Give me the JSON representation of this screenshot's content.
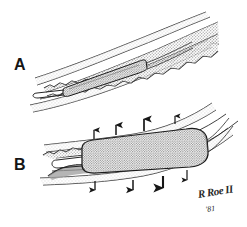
{
  "figure": {
    "kind": "medical-line-illustration",
    "medium": "pen-and-ink with stipple shading",
    "background_color": "#ffffff",
    "ink_color": "#1a1a1a",
    "stipple_color": "#8a8a8a",
    "fill_tone": "#d8d8d8",
    "width": 247,
    "height": 227
  },
  "panels": [
    {
      "id": "A",
      "label": "A",
      "caption_text": "A",
      "description": "Deflated balloon catheter positioned across a stenotic segment of a curved artery; irregular plaque lines the vessel lumen.",
      "label_position": {
        "x": 14,
        "y": 57
      }
    },
    {
      "id": "B",
      "label": "B",
      "caption_text": "B",
      "description": "Inflated balloon expanding the artery; arrows indicate outward radial force against the vessel wall.",
      "label_position": {
        "x": 14,
        "y": 157
      }
    }
  ],
  "annotations": {
    "arrow_count_upper": 4,
    "arrow_count_lower": 4,
    "arrow_meaning": "radial expansion force",
    "arrow_color": "#161616"
  },
  "signature": {
    "artist_mark": "R Roe II",
    "year": "'81",
    "position": {
      "x": 197,
      "y": 188
    }
  }
}
